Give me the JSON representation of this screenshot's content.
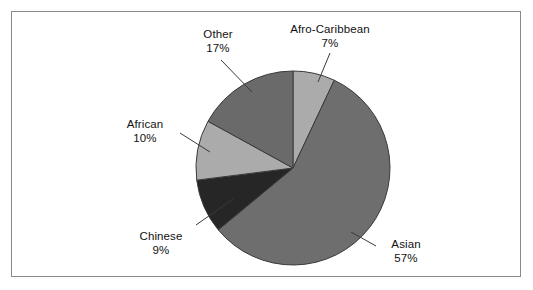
{
  "figure": {
    "background_color": "#ffffff",
    "frame_color": "#8a8a8a"
  },
  "chart_data": {
    "type": "pie",
    "title": "",
    "subtitle": "",
    "xlabel": "",
    "ylabel": "",
    "legend_position": "none",
    "grid": false,
    "labels_position": "outside-with-leader-lines",
    "start_angle_deg": 0,
    "direction": "clockwise",
    "categories": [
      "Afro-Caribbean",
      "Asian",
      "Chinese",
      "African",
      "Other"
    ],
    "values": [
      7,
      57,
      9,
      10,
      17
    ],
    "value_unit": "%",
    "slices": [
      {
        "label": "Afro-Caribbean",
        "value": 7,
        "value_text": "7%",
        "color": "#ababab",
        "start_angle_deg": 0,
        "end_angle_deg": 25.2
      },
      {
        "label": "Asian",
        "value": 57,
        "value_text": "57%",
        "color": "#6e6e6e",
        "start_angle_deg": 25.2,
        "end_angle_deg": 230.4
      },
      {
        "label": "Chinese",
        "value": 9,
        "value_text": "9%",
        "color": "#262626",
        "start_angle_deg": 230.4,
        "end_angle_deg": 262.8
      },
      {
        "label": "African",
        "value": 10,
        "value_text": "10%",
        "color": "#ababab",
        "start_angle_deg": 262.8,
        "end_angle_deg": 298.8
      },
      {
        "label": "Other",
        "value": 17,
        "value_text": "17%",
        "color": "#6a6a6a",
        "start_angle_deg": 298.8,
        "end_angle_deg": 360
      }
    ],
    "total": 100,
    "outline_color": "#3a3a3a"
  }
}
